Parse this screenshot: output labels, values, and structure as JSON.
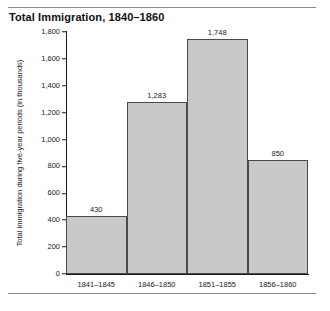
{
  "chart_data": {
    "type": "bar",
    "title": "Total Immigration, 1840–1860",
    "xlabel": "",
    "ylabel": "Total immigration during five-year periods (in thousands)",
    "categories": [
      "1841–1845",
      "1846–1850",
      "1851–1855",
      "1856–1860"
    ],
    "values": [
      430,
      1283,
      1748,
      850
    ],
    "value_labels": [
      "430",
      "1,283",
      "1,748",
      "850"
    ],
    "ylim": [
      0,
      1800
    ],
    "ytick_values": [
      0,
      200,
      400,
      600,
      800,
      1000,
      1200,
      1400,
      1600,
      1800
    ],
    "ytick_labels": [
      "0",
      "200",
      "400",
      "600",
      "800",
      "1,000",
      "1,200",
      "1,400",
      "1,600",
      "1,800"
    ],
    "grid": false,
    "legend": false,
    "bar_fill_color": "#c9c9c9",
    "bar_edge_color": "#4a4a4a",
    "axis_color": "#1a1a1a",
    "rule_color": "#8a8a8a"
  }
}
